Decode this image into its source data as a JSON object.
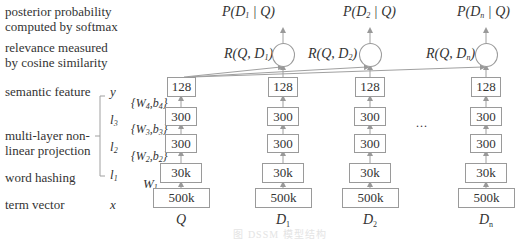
{
  "left_labels": {
    "posterior_1": "posterior probability",
    "posterior_2": "computed by softmax",
    "relevance_1": "relevance measured",
    "relevance_2": "by cosine similarity",
    "semantic": "semantic feature",
    "multilayer_1": "multi-layer non-",
    "multilayer_2": "linear projection",
    "hashing": "word hashing",
    "term": "term vector"
  },
  "layer_symbols": {
    "y": "y",
    "l3": "l",
    "l3_sub": "3",
    "l2": "l",
    "l2_sub": "2",
    "l1": "l",
    "l1_sub": "1",
    "x": "x"
  },
  "weights": {
    "w4": "{W",
    "w4_sub": "4",
    "w4_mid": ",b",
    "w4_sub2": "4",
    "w4_end": "}",
    "w3": "{W",
    "w3_sub": "3",
    "w3_mid": ",b",
    "w3_sub2": "3",
    "w3_end": "}",
    "w2": "{W",
    "w2_sub": "2",
    "w2_mid": ",b",
    "w2_sub2": "2",
    "w2_end": "}",
    "w1": "W",
    "w1_sub": "1"
  },
  "columns": [
    {
      "name": "Q",
      "sub": "",
      "layers": [
        "128",
        "300",
        "300",
        "30k",
        "500k"
      ]
    },
    {
      "name": "D",
      "sub": "1",
      "layers": [
        "128",
        "300",
        "300",
        "30k",
        "500k"
      ],
      "R": "R(Q, D",
      "R_sub": "1",
      "R_end": ")",
      "P": "P(D",
      "P_sub": "1",
      "P_end": " | Q)"
    },
    {
      "name": "D",
      "sub": "2",
      "layers": [
        "128",
        "300",
        "300",
        "30k",
        "500k"
      ],
      "R": "R(Q, D",
      "R_sub": "2",
      "R_end": ")",
      "P": "P(D",
      "P_sub": "2",
      "P_end": " | Q)"
    },
    {
      "name": "D",
      "sub": "n",
      "layers": [
        "128",
        "300",
        "300",
        "30k",
        "500k"
      ],
      "R": "R(Q, D",
      "R_sub": "n",
      "R_end": ")",
      "P": "P(D",
      "P_sub": "n",
      "P_end": " | Q)"
    }
  ],
  "ellipsis": "...",
  "caption": "图 DSSM 模型结构"
}
